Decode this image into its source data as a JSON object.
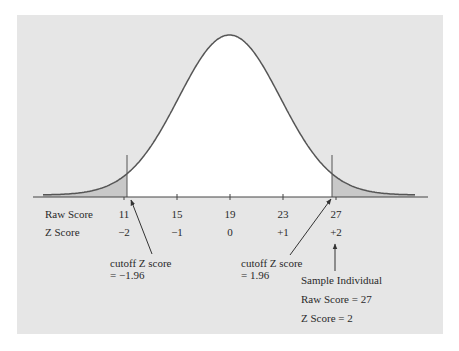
{
  "chart_data": {
    "type": "line",
    "title": "",
    "xlabel": "",
    "ylabel": "",
    "grid": false,
    "legend": null,
    "rows": [
      {
        "label": "Raw Score",
        "ticks": [
          "11",
          "15",
          "19",
          "23",
          "27"
        ]
      },
      {
        "label": "Z Score",
        "ticks": [
          "−2",
          "−1",
          "0",
          "+1",
          "+2"
        ]
      }
    ],
    "raw_scores": [
      11,
      15,
      19,
      23,
      27
    ],
    "z_scores": [
      -2,
      -1,
      0,
      1,
      2
    ],
    "mean_raw": 19,
    "sd_raw": 4,
    "shaded_regions": [
      {
        "side": "left",
        "z_cutoff": -1.96
      },
      {
        "side": "right",
        "z_cutoff": 1.96
      }
    ],
    "annotations": [
      {
        "text": [
          "cutoff Z score",
          "= −1.96"
        ],
        "points_to_z": -1.96
      },
      {
        "text": [
          "cutoff Z score",
          "= 1.96"
        ],
        "points_to_z": 1.96
      },
      {
        "text": [
          "Sample Individual",
          "Raw Score = 27",
          "Z Score = 2"
        ],
        "points_to_z": 2
      }
    ]
  },
  "labels": {
    "raw_row": "Raw Score",
    "z_row": "Z Score",
    "raw_ticks": [
      "11",
      "15",
      "19",
      "23",
      "27"
    ],
    "z_ticks": [
      "−2",
      "−1",
      "0",
      "+1",
      "+2"
    ],
    "left_cutoff_line1": "cutoff Z score",
    "left_cutoff_line2": "= −1.96",
    "right_cutoff_line1": "cutoff Z score",
    "right_cutoff_line2": "= 1.96",
    "sample_title": "Sample Individual",
    "sample_raw": "Raw Score = 27",
    "sample_z": "Z Score = 2"
  },
  "colors": {
    "panel": "#e6e6e6",
    "tail_fill": "#c8c8c8",
    "line": "#555555",
    "text": "#2a2a2a"
  }
}
